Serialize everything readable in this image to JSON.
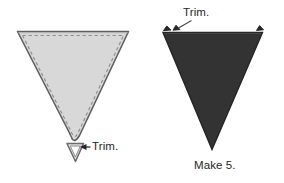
{
  "figure": {
    "background_color": "#ffffff",
    "width": 284,
    "height": 183
  },
  "left_unit": {
    "name": "trimmed-triangle-with-seam-allowance",
    "fill_color": "#d8d8d8",
    "outline_color": "#5a5a5a",
    "stitch_line_color": "#8a8a8a",
    "stitch_line_style": "dashed",
    "tip_shape": "blunted",
    "trim_label": "Trim.",
    "scrap_piece": "v-shaped-point-scrap"
  },
  "right_unit": {
    "name": "finished-dark-triangle",
    "fill_color": "#333333",
    "outline_color": "#1f1f1f",
    "tip_shape": "sharp-point",
    "trim_label": "Trim.",
    "dog_ear_scraps": 2,
    "caption": "Make 5."
  },
  "annotations": {
    "left_arrow_direction": "left",
    "right_leader_direction": "down-left"
  }
}
